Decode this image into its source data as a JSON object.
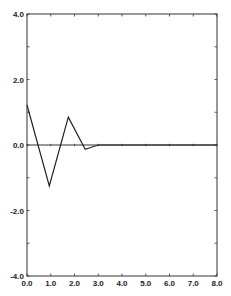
{
  "chart_data": {
    "type": "line",
    "title": "",
    "xlabel": "",
    "ylabel": "",
    "xlim": [
      0.0,
      8.0
    ],
    "ylim": [
      -4.0,
      4.0
    ],
    "grid": false,
    "legend": null,
    "x_ticks": [
      "0.0",
      "1.0",
      "2.0",
      "3.0",
      "4.0",
      "5.0",
      "6.0",
      "7.0",
      "8.0"
    ],
    "y_ticks": [
      "4.0",
      "2.0",
      "0.0",
      "-2.0",
      "-4.0"
    ],
    "x_tick_values": [
      0,
      1,
      2,
      3,
      4,
      5,
      6,
      7,
      8
    ],
    "y_tick_values": [
      4,
      2,
      0,
      -2,
      -4
    ],
    "y_minor_tick_values": [
      3,
      1,
      -1,
      -3
    ],
    "zero_line": true,
    "series": [
      {
        "name": "response",
        "x": [
          0.0,
          0.94,
          1.74,
          2.45,
          3.0,
          4.0,
          5.0,
          6.0,
          7.0,
          8.0
        ],
        "y": [
          1.22,
          -1.25,
          0.85,
          -0.13,
          0.0,
          0.0,
          0.0,
          0.0,
          0.0,
          0.0
        ]
      }
    ]
  },
  "colors": {
    "axis": "#333333",
    "line": "#222222",
    "background": "#ffffff"
  }
}
